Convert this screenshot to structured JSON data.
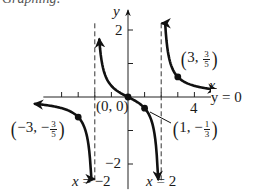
{
  "header_fragment": "Graphing:",
  "chart_data": {
    "type": "line",
    "title": "",
    "function": "y = x/(x^2 - 4)",
    "xlabel": "x",
    "ylabel": "y",
    "xlim": [
      -7.6,
      7.9
    ],
    "ylim": [
      -2.8,
      2.9
    ],
    "grid": false,
    "x_ticks": [
      -4,
      -3,
      -2,
      -1,
      1,
      2,
      3,
      4
    ],
    "y_ticks": [
      -2,
      -1,
      1,
      2
    ],
    "tick_labels": {
      "x": [
        "4"
      ],
      "y": [
        "2",
        "-2"
      ]
    },
    "vertical_asymptotes": [
      {
        "x": -2,
        "label": "x = -2"
      },
      {
        "x": 2,
        "label": "x = 2"
      }
    ],
    "horizontal_asymptote": {
      "y": 0,
      "label": "y = 0"
    },
    "points": [
      {
        "x": -3,
        "y": -0.6,
        "label": "(-3, -3/5)"
      },
      {
        "x": 0,
        "y": 0,
        "label": "(0, 0)"
      },
      {
        "x": 1,
        "y": -0.3333,
        "label": "(1, -1/3)"
      },
      {
        "x": 3,
        "y": 0.6,
        "label": "(3, 3/5)"
      }
    ],
    "series": [
      {
        "name": "left branch",
        "x_range": [
          -5.6,
          -2.07
        ]
      },
      {
        "name": "middle branch",
        "x_range": [
          -1.73,
          1.82
        ]
      },
      {
        "name": "right branch",
        "x_range": [
          2.08,
          5.3
        ]
      }
    ],
    "layout": {
      "origin_px": [
        128,
        97
      ],
      "px_per_unit_x": 16.6,
      "px_per_unit_y": 33.5
    }
  },
  "labels": {
    "y_axis": "y",
    "x_axis": "x",
    "y_tick_2": "2",
    "y_tick_neg2": "−2",
    "x_tick_4": "4",
    "h_asymptote": "y = 0",
    "v_asym_left_prefix": "x",
    "v_asym_left_value": " = −2",
    "v_asym_right_prefix": "x",
    "v_asym_right_value": " = 2",
    "origin": "(0, 0)",
    "pt_right_x": "3,",
    "pt_right_num": "3",
    "pt_right_den": "5",
    "pt_left_x": "−3, −",
    "pt_left_num": "3",
    "pt_left_den": "5",
    "pt_mid_x": "1, −",
    "pt_mid_num": "1",
    "pt_mid_den": "3",
    "paren_open": "(",
    "paren_close": ")"
  }
}
